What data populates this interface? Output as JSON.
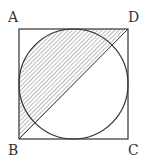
{
  "diagram": {
    "type": "geometry",
    "labels": {
      "A": "A",
      "B": "B",
      "C": "C",
      "D": "D"
    },
    "vertices": {
      "A": [
        19,
        29
      ],
      "B": [
        19,
        139
      ],
      "C": [
        128,
        139
      ],
      "D": [
        128,
        29
      ]
    },
    "circle": {
      "cx": 73.5,
      "cy": 84,
      "r": 54.5
    },
    "diagonal": [
      "B",
      "D"
    ],
    "colors": {
      "stroke": "#333333",
      "hatch": "#555555",
      "background": "#ffffff"
    }
  }
}
